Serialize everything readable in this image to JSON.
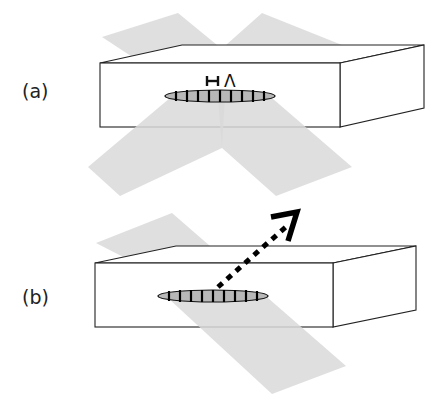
{
  "figure": {
    "panels": [
      {
        "id": "a",
        "label": "(a)",
        "period_symbol": "Λ",
        "scale_bar_glyph": "H",
        "description": "Two crossed light beams incident from below form an interference grating inside a block"
      },
      {
        "id": "b",
        "label": "(b)",
        "description": "Single beam incident on the recorded grating, diffracted beam exits (dotted arrow)"
      }
    ],
    "colors": {
      "beam": "#d9d9d9",
      "grating_fill": "#b8b8b8",
      "outline": "#222222",
      "arrow": "#000000"
    }
  }
}
